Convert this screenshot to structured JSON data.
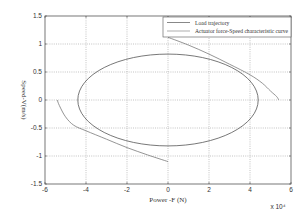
{
  "chart_data": {
    "type": "line",
    "title": "",
    "xlabel": "Power -F (N)",
    "ylabel": "Speed-V(m/s)",
    "x_multiplier_label": "x 10⁴",
    "xlim": [
      -6,
      6
    ],
    "ylim": [
      -1.5,
      1.5
    ],
    "x_scale": 10000,
    "xticks": [
      -6,
      -4,
      -2,
      0,
      2,
      4,
      6
    ],
    "xtick_labels": [
      "-6",
      "-4",
      "-2",
      "0",
      "2",
      "4",
      "6"
    ],
    "yticks": [
      1.5,
      1,
      0.5,
      0,
      -0.5,
      -1,
      -1.5
    ],
    "ytick_labels": [
      "1.5",
      "1",
      "0.5",
      "0",
      "-0.5",
      "-1",
      "-1.5"
    ],
    "grid": true,
    "legend_position": "upper right",
    "series": [
      {
        "name": "Load trajectory",
        "kind": "ellipse",
        "color": "#555555",
        "center": [
          0,
          0
        ],
        "x_radius": 4.4,
        "y_radius": 0.82
      },
      {
        "name": "Actuator force-Speed characteristic curve",
        "kind": "polyline",
        "color": "#7a7a7a",
        "segments": [
          {
            "x": [
              0,
              1,
              2,
              3,
              4,
              4.6,
              5.0,
              5.3,
              5.4
            ],
            "y": [
              1.12,
              0.98,
              0.82,
              0.64,
              0.45,
              0.3,
              0.16,
              0.06,
              0.0
            ]
          },
          {
            "x": [
              -5.4,
              -5.3,
              -5.0,
              -4.6,
              -4,
              -3,
              -2,
              -1,
              0
            ],
            "y": [
              0.0,
              -0.1,
              -0.3,
              -0.45,
              -0.55,
              -0.7,
              -0.85,
              -0.98,
              -1.1
            ]
          }
        ]
      }
    ]
  }
}
